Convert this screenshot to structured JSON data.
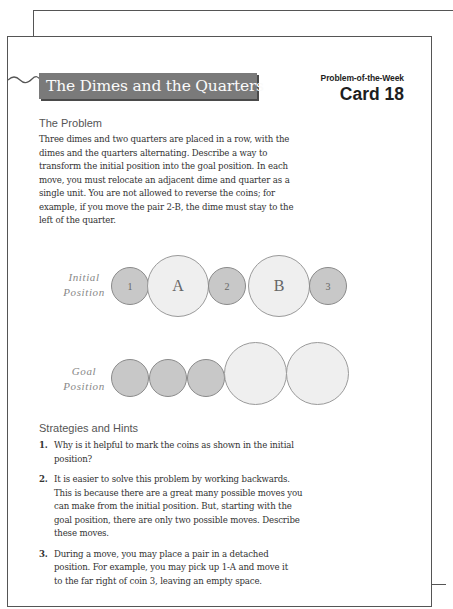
{
  "card": {
    "title": "The Dimes and the Quarters",
    "series_label": "Problem-of-the-Week",
    "card_number": "Card 18"
  },
  "problem": {
    "heading": "The Problem",
    "lines": [
      "Three dimes and two quarters are placed in a row, with the",
      "dimes and the quarters alternating. Describe a way to",
      "transform the initial position into the goal position. In each",
      "move, you must relocate an adjacent dime and quarter as a",
      "single unit. You are not allowed to reverse the coins; for",
      "example, if you move the pair 2-B, the dime must stay to the",
      "left of the quarter."
    ]
  },
  "diagram": {
    "initial": {
      "label_line1": "Initial",
      "label_line2": "Position",
      "coins": [
        {
          "type": "dime",
          "label": "1"
        },
        {
          "type": "quarter",
          "label": "A"
        },
        {
          "type": "dime",
          "label": "2"
        },
        {
          "type": "quarter",
          "label": "B"
        },
        {
          "type": "dime",
          "label": "3"
        }
      ]
    },
    "goal": {
      "label_line1": "Goal",
      "label_line2": "Position",
      "coins": [
        {
          "type": "dime",
          "label": ""
        },
        {
          "type": "dime",
          "label": ""
        },
        {
          "type": "dime",
          "label": ""
        },
        {
          "type": "quarter",
          "label": ""
        },
        {
          "type": "quarter",
          "label": ""
        }
      ]
    },
    "colors": {
      "dime_fill": "#c8c8c8",
      "quarter_fill": "#efefef",
      "banner": "#7a7a7a"
    }
  },
  "hints": {
    "heading": "Strategies and Hints",
    "items": [
      {
        "number": "1.",
        "lines": [
          "Why is it helpful to mark the coins as shown in the initial",
          "position?"
        ]
      },
      {
        "number": "2.",
        "lines": [
          "It is easier to solve this problem by working backwards.",
          "This is because there are a great many possible moves you",
          "can make from the initial position. But, starting with the",
          "goal position, there are only two possible moves. Describe",
          "these moves."
        ]
      },
      {
        "number": "3.",
        "lines": [
          "During a move, you may place a pair in a detached",
          "position. For example, you may pick up 1-A and move it",
          "to the far right of coin 3, leaving an empty space."
        ]
      }
    ]
  }
}
